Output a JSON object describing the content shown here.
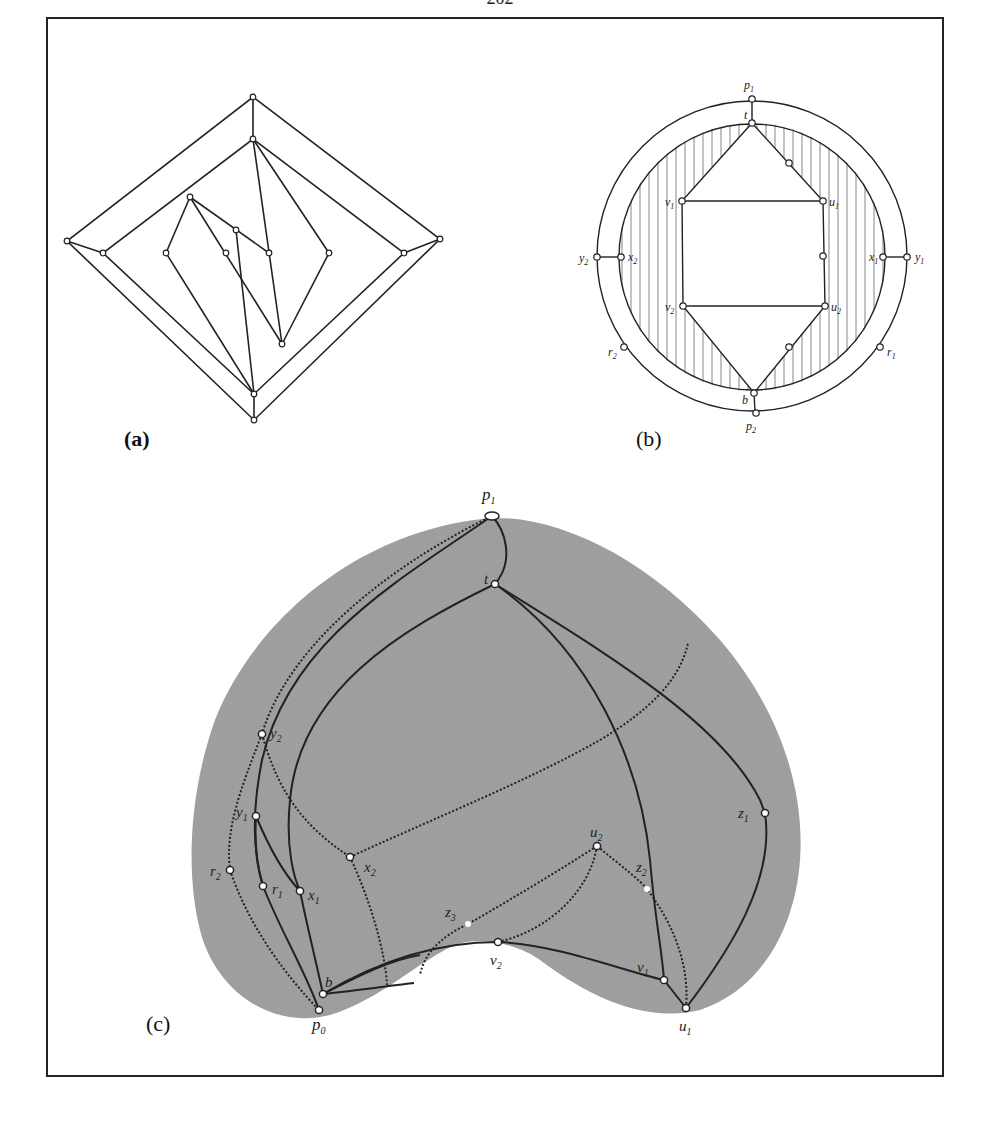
{
  "page": {
    "number": "202"
  },
  "figure": {
    "panels": [
      {
        "id": "a",
        "label": "(a)"
      },
      {
        "id": "b",
        "label": "(b)"
      },
      {
        "id": "c",
        "label": "(c)"
      }
    ],
    "panel_b": {
      "vertex_labels": {
        "p1": "p",
        "p1_sub": "1",
        "t": "t",
        "v1": "v",
        "v1_sub": "1",
        "u1": "u",
        "u1_sub": "1",
        "v2": "v",
        "v2_sub": "2",
        "u2": "u",
        "u2_sub": "2",
        "x1": "x",
        "x1_sub": "1",
        "x2": "x",
        "x2_sub": "2",
        "y1": "y",
        "y1_sub": "1",
        "y2": "y",
        "y2_sub": "2",
        "r1": "r",
        "r1_sub": "1",
        "r2": "r",
        "r2_sub": "2",
        "b": "b",
        "p2": "p",
        "p2_sub": "2"
      }
    },
    "panel_c": {
      "vertex_labels": {
        "p1": "p",
        "p1_sub": "1",
        "t": "t",
        "y2": "y",
        "y2_sub": "2",
        "y1": "y",
        "y1_sub": "1",
        "x2": "x",
        "x2_sub": "2",
        "r2": "r",
        "r2_sub": "2",
        "r1": "r",
        "r1_sub": "1",
        "x1": "x",
        "x1_sub": "1",
        "z3": "z",
        "z3_sub": "3",
        "v2": "v",
        "v2_sub": "2",
        "b": "b",
        "p0": "p",
        "p0_sub": "0",
        "u2": "u",
        "u2_sub": "2",
        "z2": "z",
        "z2_sub": "2",
        "z1": "z",
        "z1_sub": "1",
        "v1": "v",
        "v1_sub": "1",
        "u1": "u",
        "u1_sub": "1"
      }
    },
    "colors": {
      "ink": "#222222",
      "shade": "#9a9a9a",
      "hatch": "#555555"
    }
  }
}
